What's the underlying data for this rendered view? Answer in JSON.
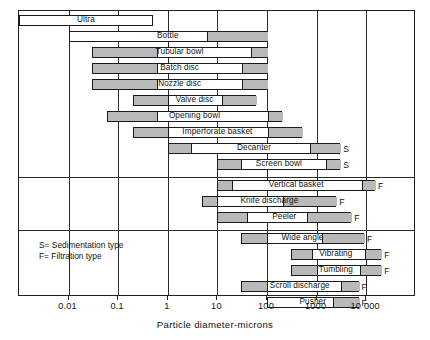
{
  "chart_data": {
    "type": "bar",
    "title": "",
    "xlabel": "Particle diameter-microns",
    "ylabel": "",
    "xscale": "log",
    "xlim": [
      0.001,
      100000
    ],
    "grid": true,
    "legend_position": "inside-lower-left",
    "tick_labels": [
      "0.01",
      "0.1",
      "1",
      "10",
      "100",
      "1000",
      "10 000"
    ],
    "tick_values": [
      0.01,
      0.1,
      1,
      10,
      100,
      1000,
      10000
    ],
    "legend_entries": [
      "S= Sedimentation type",
      "F= Filtration type"
    ],
    "annotations": {
      "S": "Sedimentation type",
      "F": "Filtration type"
    },
    "groups": [
      {
        "name": "sedimentation-centrifuges",
        "rows": [
          {
            "label": "Ultra",
            "x_start": 0.001,
            "x_end": 0.5,
            "tag": "",
            "segments": []
          },
          {
            "label": "Bottle",
            "x_start": 0.01,
            "x_end": 100,
            "tag": "",
            "segments": [
              {
                "from": 6.0,
                "to": 100
              }
            ]
          },
          {
            "label": "Tubular bowl",
            "x_start": 0.03,
            "x_end": 100,
            "tag": "",
            "segments": [
              {
                "from": 0.03,
                "to": 0.6
              },
              {
                "from": 45,
                "to": 100
              }
            ]
          },
          {
            "label": "Batch disc",
            "x_start": 0.03,
            "x_end": 100,
            "tag": "",
            "segments": [
              {
                "from": 0.03,
                "to": 0.6
              },
              {
                "from": 30,
                "to": 100
              }
            ]
          },
          {
            "label": "Nozzle disc",
            "x_start": 0.03,
            "x_end": 100,
            "tag": "",
            "segments": [
              {
                "from": 0.03,
                "to": 0.6
              },
              {
                "from": 30,
                "to": 100
              }
            ]
          },
          {
            "label": "Valve disc",
            "x_start": 0.2,
            "x_end": 60,
            "tag": "",
            "segments": [
              {
                "from": 0.2,
                "to": 1.0
              },
              {
                "from": 12,
                "to": 60
              }
            ]
          },
          {
            "label": "Opening bowl",
            "x_start": 0.06,
            "x_end": 200,
            "tag": "",
            "segments": [
              {
                "from": 0.06,
                "to": 0.6
              },
              {
                "from": 100,
                "to": 200
              }
            ]
          },
          {
            "label": "Imperforate basket",
            "x_start": 0.2,
            "x_end": 500,
            "tag": "",
            "segments": [
              {
                "from": 0.2,
                "to": 1.0
              },
              {
                "from": 100,
                "to": 500
              }
            ]
          },
          {
            "label": "Decanter",
            "x_start": 1.0,
            "x_end": 3000,
            "tag": "S",
            "segments": [
              {
                "from": 1.0,
                "to": 3.0
              },
              {
                "from": 700,
                "to": 3000
              }
            ]
          },
          {
            "label": "Screen bowl",
            "x_start": 10,
            "x_end": 3000,
            "tag": "S",
            "segments": [
              {
                "from": 10,
                "to": 30
              },
              {
                "from": 1500,
                "to": 3000
              }
            ]
          }
        ]
      },
      {
        "name": "filtering-centrifuges-batch",
        "rows": [
          {
            "label": "Vertical basket",
            "x_start": 10,
            "x_end": 15000,
            "tag": "F",
            "segments": [
              {
                "from": 10,
                "to": 20
              },
              {
                "from": 8000,
                "to": 15000
              }
            ]
          },
          {
            "label": "Knife discharge",
            "x_start": 5,
            "x_end": 2500,
            "tag": "F",
            "segments": [
              {
                "from": 5,
                "to": 10
              },
              {
                "from": 200,
                "to": 2500
              }
            ]
          },
          {
            "label": "Peeler",
            "x_start": 10,
            "x_end": 5000,
            "tag": "F",
            "segments": [
              {
                "from": 10,
                "to": 40
              },
              {
                "from": 600,
                "to": 5000
              }
            ]
          }
        ]
      },
      {
        "name": "filtering-centrifuges-continuous",
        "rows": [
          {
            "label": "Wide angle",
            "x_start": 30,
            "x_end": 9000,
            "tag": "F",
            "segments": [
              {
                "from": 30,
                "to": 100
              },
              {
                "from": 1200,
                "to": 9000
              }
            ]
          },
          {
            "label": "Vibrating",
            "x_start": 300,
            "x_end": 20000,
            "tag": "F",
            "segments": [
              {
                "from": 300,
                "to": 800
              },
              {
                "from": 9000,
                "to": 20000
              }
            ]
          },
          {
            "label": "Tumbling",
            "x_start": 300,
            "x_end": 20000,
            "tag": "F",
            "segments": [
              {
                "from": 300,
                "to": 1000
              },
              {
                "from": 7000,
                "to": 20000
              }
            ]
          },
          {
            "label": "Scroll discharge",
            "x_start": 30,
            "x_end": 7000,
            "tag": "F",
            "segments": [
              {
                "from": 30,
                "to": 100
              },
              {
                "from": 3000,
                "to": 7000
              }
            ]
          },
          {
            "label": "Pusher",
            "x_start": 100,
            "x_end": 7000,
            "tag": "F",
            "segments": [
              {
                "from": 2000,
                "to": 7000
              }
            ]
          }
        ]
      }
    ]
  },
  "colors": {
    "bar_fill_gray": "#b9b9b9",
    "bar_fill_white": "#ffffff",
    "stroke": "#1a1a1a",
    "background": "#ffffff"
  }
}
